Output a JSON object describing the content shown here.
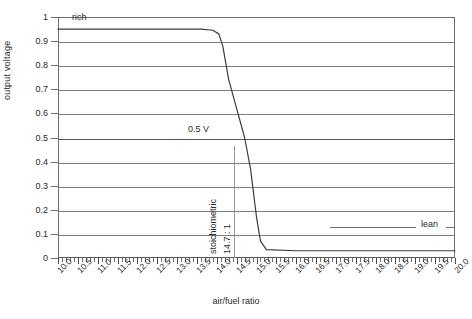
{
  "chart_data": {
    "type": "line",
    "title": "",
    "xlabel": "air/fuel ratio",
    "ylabel": "output voltage",
    "xlim": [
      10.0,
      20.0
    ],
    "ylim": [
      0,
      1
    ],
    "grid": true,
    "legend": "none",
    "x_ticks": [
      "10.0",
      "10.5",
      "11.0",
      "11.5",
      "12.0",
      "12.5",
      "13.0",
      "13.5",
      "14.0",
      "14.5",
      "15.0",
      "15.5",
      "16.0",
      "16.5",
      "17.0",
      "17.5",
      "18.0",
      "18.5",
      "19.0",
      "19.5",
      "20.0"
    ],
    "x_tick_values": [
      10.0,
      10.5,
      11.0,
      11.5,
      12.0,
      12.5,
      13.0,
      13.5,
      14.0,
      14.5,
      15.0,
      15.5,
      16.0,
      16.5,
      17.0,
      17.5,
      18.0,
      18.5,
      19.0,
      19.5,
      20.0
    ],
    "y_ticks": [
      "0",
      "0.1",
      "0.2",
      "0.3",
      "0.4",
      "0.5",
      "0.6",
      "0.7",
      "0.8",
      "0.9",
      "1"
    ],
    "y_tick_values": [
      0,
      0.1,
      0.2,
      0.3,
      0.4,
      0.5,
      0.6,
      0.7,
      0.8,
      0.9,
      1
    ],
    "series": [
      {
        "name": "lambda sensor output",
        "x": [
          10.0,
          11.0,
          12.0,
          13.0,
          13.6,
          13.9,
          14.05,
          14.15,
          14.3,
          14.5,
          14.7,
          14.85,
          15.0,
          15.1,
          15.25,
          16.0,
          17.0,
          18.0,
          19.0,
          20.0
        ],
        "y": [
          0.95,
          0.95,
          0.95,
          0.95,
          0.95,
          0.945,
          0.93,
          0.88,
          0.74,
          0.62,
          0.5,
          0.37,
          0.17,
          0.07,
          0.035,
          0.03,
          0.03,
          0.03,
          0.03,
          0.03
        ]
      }
    ],
    "annotations": [
      {
        "name": "rich",
        "text": "rich",
        "x": 10.0,
        "y": 1.0
      },
      {
        "name": "lean",
        "text": "lean",
        "x": 20.0,
        "y": 0.1
      },
      {
        "name": "half-volt",
        "text": "0.5 V",
        "x": 13.5,
        "y": 0.55
      },
      {
        "name": "stoichiometric",
        "text": "stoichiometric",
        "x": 14.7,
        "y": 0.2
      },
      {
        "name": "stoich-ratio",
        "text": "14.7 : 1",
        "x": 14.7,
        "y": 0.2
      }
    ],
    "colors": {
      "curve": "#3c3c3c",
      "gridline": "#7d7d7d",
      "axis": "#5a5a5a",
      "text": "#2a2a2a",
      "background": "#ffffff"
    }
  }
}
